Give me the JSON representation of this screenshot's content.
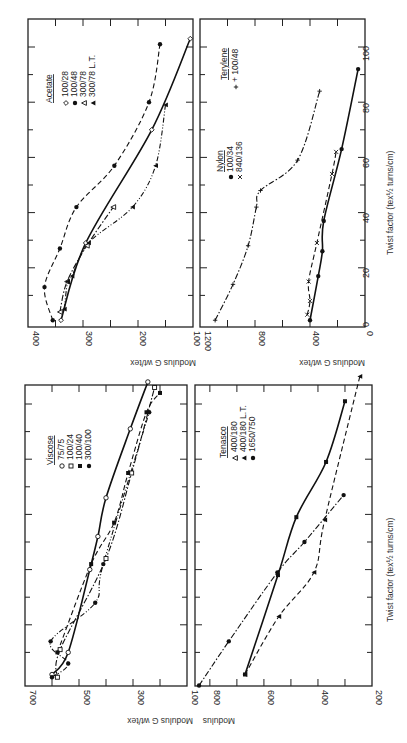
{
  "figure": {
    "orientation": "rotated 90 degrees counter-clockwise",
    "shared_xlabel": "Twist factor (tex½ turns/cm)",
    "shared_ylabel": "Modulus G wt/tex"
  },
  "chart_data": [
    {
      "type": "line",
      "panel": "top-left",
      "legend_title": "Acetate",
      "xlabel": "",
      "ylabel": "Modulus G wt/tex",
      "xlim": [
        0,
        100
      ],
      "ylim": [
        100,
        400
      ],
      "yticks": [
        "100",
        "200",
        "300",
        "400"
      ],
      "xticks": [],
      "series": [
        {
          "name": "100/28",
          "marker": "open-diamond",
          "line": "solid",
          "x": [
            1,
            29,
            70,
            103
          ],
          "y": [
            340,
            295,
            175,
            105
          ]
        },
        {
          "name": "100/48",
          "marker": "filled-circle",
          "line": "dashed",
          "x": [
            1,
            13,
            27,
            42,
            57,
            80,
            101
          ],
          "y": [
            355,
            370,
            342,
            312,
            243,
            180,
            160
          ]
        },
        {
          "name": "300/78",
          "marker": "open-triangle",
          "line": "dash-dot",
          "x": [
            4,
            15,
            28,
            42
          ],
          "y": [
            342,
            329,
            293,
            245
          ]
        },
        {
          "name": "300/78 L.T.",
          "marker": "filled-triangle",
          "line": "dash-dot-dot",
          "x": [
            5,
            15,
            17,
            29,
            42,
            57,
            79
          ],
          "y": [
            334,
            328,
            320,
            290,
            210,
            168,
            150
          ]
        }
      ]
    },
    {
      "type": "line",
      "panel": "top-right",
      "legend_groups": [
        {
          "title": "Nylon",
          "entries": [
            "100/34",
            "840/136"
          ]
        },
        {
          "title": "Terylene",
          "entries": [
            "100/48"
          ]
        }
      ],
      "xlabel": "Twist factor (tex½ turns/cm)",
      "ylabel": "Modulus G wt/tex",
      "xlim": [
        0,
        110
      ],
      "ylim": [
        0,
        1200
      ],
      "xticks": [
        "0",
        "20",
        "40",
        "60",
        "80",
        "100"
      ],
      "yticks": [
        "0",
        "400",
        "800",
        "1200"
      ],
      "series": [
        {
          "name": "Nylon 100/34",
          "marker": "filled-circle",
          "line": "solid",
          "x": [
            1,
            17,
            26,
            37,
            63,
            92
          ],
          "y": [
            400,
            340,
            310,
            300,
            170,
            50
          ]
        },
        {
          "name": "Nylon 840/136",
          "marker": "cross-x",
          "line": "dashed",
          "x": [
            3,
            8,
            15,
            29,
            54,
            62
          ],
          "y": [
            420,
            400,
            410,
            350,
            240,
            210
          ]
        },
        {
          "name": "Terylene 100/48",
          "marker": "plus",
          "line": "dash-dot",
          "x": [
            1,
            14,
            28,
            42,
            48,
            59,
            84
          ],
          "y": [
            1090,
            960,
            850,
            790,
            760,
            490,
            330
          ]
        }
      ]
    },
    {
      "type": "line",
      "panel": "bottom-left",
      "legend_title": "Viscose",
      "xlabel": "",
      "ylabel": "Modulus G wt/tex",
      "xlim": [
        0,
        110
      ],
      "ylim": [
        100,
        700
      ],
      "yticks": [
        "100",
        "300",
        "500",
        "700"
      ],
      "xticks": [],
      "series": [
        {
          "name": "75/75",
          "marker": "open-circle",
          "line": "solid",
          "x": [
            2,
            10,
            40,
            52,
            66,
            91,
            108
          ],
          "y": [
            600,
            540,
            460,
            430,
            400,
            310,
            245
          ]
        },
        {
          "name": "100/24",
          "marker": "open-square",
          "line": "dash-dot",
          "x": [
            1,
            11,
            44,
            75,
            106
          ],
          "y": [
            580,
            570,
            400,
            305,
            220
          ]
        },
        {
          "name": "100/40",
          "marker": "filled-square",
          "line": "dashed",
          "x": [
            10,
            42,
            57,
            75,
            97,
            104
          ],
          "y": [
            580,
            455,
            370,
            318,
            250,
            200
          ]
        },
        {
          "name": "300/100",
          "marker": "filled-circle",
          "line": "dash-dot-dot",
          "x": [
            1,
            6,
            14,
            28,
            42,
            97
          ],
          "y": [
            600,
            540,
            605,
            440,
            410,
            240
          ]
        }
      ]
    },
    {
      "type": "line",
      "panel": "bottom-right",
      "legend_title": "Tenasco",
      "xlabel": "Twist factor (tex½ turns/cm)",
      "ylabel": "Modulus",
      "xlim": [
        0,
        110
      ],
      "ylim": [
        200,
        855
      ],
      "yticks": [
        "200",
        "400",
        "600",
        "800"
      ],
      "xticks": [],
      "series": [
        {
          "name": "400/180",
          "marker": "open-triangle",
          "line": "none",
          "x": [],
          "y": []
        },
        {
          "name": "400/180 L.T.",
          "marker": "filled-triangle",
          "line": "dashed",
          "x": [
            2,
            23,
            39,
            58,
            110
          ],
          "y": [
            670,
            545,
            415,
            375,
            245
          ]
        },
        {
          "name": "1650/750",
          "marker": "filled-circle",
          "line": "dash-dot",
          "x": [
            -2,
            14,
            39,
            50,
            67
          ],
          "y": [
            840,
            730,
            550,
            450,
            305
          ]
        },
        {
          "name": "1650/750 (square)",
          "marker": "filled-square",
          "line": "solid",
          "x": [
            2,
            38,
            59,
            79,
            101
          ],
          "y": [
            670,
            548,
            480,
            370,
            300
          ]
        }
      ]
    }
  ],
  "panels": {
    "acetate": {
      "legend_title": "Acetate",
      "legend": [
        "100/28",
        "100/48",
        "300/78",
        "300/78 L.T."
      ],
      "yticks": [
        "400",
        "300",
        "200",
        "100"
      ],
      "ylabel": "Modulus G wt/tex"
    },
    "nylon": {
      "legend_title": "Nylon",
      "legend": [
        "100/34",
        "840/136"
      ],
      "legend2_title": "Terylene",
      "legend2": [
        "+ 100/48"
      ],
      "yticks": [
        "1200",
        "800",
        "400",
        "0"
      ],
      "xticks": [
        "0",
        "20",
        "40",
        "60",
        "80",
        "100"
      ],
      "xlabel": "Twist factor (tex½ turns/cm)",
      "ylabel": "Modulus G wt/tex"
    },
    "viscose": {
      "legend_title": "Viscose",
      "legend": [
        "75/75",
        "100/24",
        "100/40",
        "300/100"
      ],
      "yticks": [
        "700",
        "500",
        "300",
        "100"
      ],
      "ylabel": "Modulus G wt/tex"
    },
    "tenasco": {
      "legend_title": "Tenasco",
      "legend": [
        "400/180",
        "400/180 L.T.",
        "1650/750"
      ],
      "yticks": [
        "800",
        "600",
        "400",
        "200"
      ],
      "xlabel": "Twist factor (tex½ turns/cm)",
      "ylabel": "Modulus"
    }
  }
}
